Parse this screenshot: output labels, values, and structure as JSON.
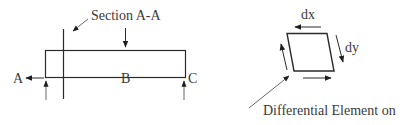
{
  "beam_diagram": {
    "section_label": "Section A-A",
    "point_a": "A",
    "point_b": "B",
    "point_c": "C"
  },
  "element_diagram": {
    "dx_label": "dx",
    "dy_label": "dy",
    "caption": "Differential Element on"
  },
  "colors": {
    "stroke": "#2a2a2a",
    "text": "#3a3a3a",
    "background": "#ffffff"
  }
}
